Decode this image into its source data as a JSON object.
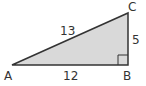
{
  "diagram": {
    "type": "right-triangle",
    "vertices": {
      "A": {
        "label": "A",
        "x": 12,
        "y": 65
      },
      "B": {
        "label": "B",
        "x": 128,
        "y": 65
      },
      "C": {
        "label": "C",
        "x": 128,
        "y": 13
      }
    },
    "sides": {
      "AC": {
        "label": "13"
      },
      "AB": {
        "label": "12"
      },
      "BC": {
        "label": "5"
      }
    },
    "right_angle_at": "B",
    "colors": {
      "fill": "#d9d9d9",
      "stroke": "#333333",
      "text": "#333333"
    }
  }
}
